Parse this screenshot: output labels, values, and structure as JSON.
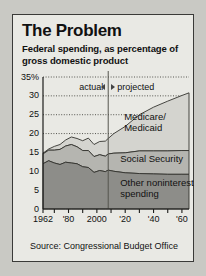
{
  "card": {
    "title": "The Problem",
    "subtitle": "Federal spending, as percentage of gross domestic product",
    "source": "Source: Congressional Budget Office"
  },
  "annotations": {
    "actual_label": "actual",
    "projected_label": "projected",
    "left_arrow": "arrow-left-icon",
    "right_arrow": "arrow-right-icon",
    "divider_year": 2008
  },
  "chart_data": {
    "type": "area",
    "stacked": true,
    "title": "Federal spending, as percentage of gross domestic product",
    "xlabel": "",
    "ylabel": "",
    "xlim": [
      1962,
      2065
    ],
    "ylim": [
      0,
      35
    ],
    "ytick_values": [
      0,
      5,
      10,
      15,
      20,
      25,
      30,
      35
    ],
    "ytick_labels": [
      "0",
      "5",
      "10",
      "15",
      "20",
      "25",
      "30",
      "35%"
    ],
    "xtick_values": [
      1962,
      1970,
      1980,
      1990,
      2000,
      2010,
      2020,
      2030,
      2040,
      2050,
      2060
    ],
    "xtick_labels": [
      "1962",
      "",
      "'80",
      "",
      "2000",
      "",
      "'20",
      "",
      "'40",
      "",
      "'60"
    ],
    "grid": "horizontal-dotted",
    "legend_position": "inline-band-labels",
    "series": [
      {
        "name": "Other noninterest spending",
        "color": "#8d8d89",
        "x": [
          1962,
          1966,
          1970,
          1974,
          1978,
          1982,
          1986,
          1990,
          1994,
          1998,
          2002,
          2006,
          2008,
          2012,
          2020,
          2030,
          2040,
          2050,
          2060,
          2065
        ],
        "values": [
          12.0,
          12.8,
          12.2,
          11.8,
          12.4,
          12.2,
          12.0,
          11.2,
          11.0,
          9.7,
          10.2,
          9.9,
          10.3,
          10.0,
          9.6,
          9.4,
          9.3,
          9.2,
          9.2,
          9.2
        ]
      },
      {
        "name": "Social Security",
        "color": "#b5b5b0",
        "x": [
          1962,
          1966,
          1970,
          1974,
          1978,
          1982,
          1986,
          1990,
          1994,
          1998,
          2002,
          2006,
          2008,
          2012,
          2020,
          2030,
          2040,
          2050,
          2060,
          2065
        ],
        "values": [
          2.6,
          2.8,
          3.4,
          4.0,
          4.3,
          4.9,
          4.5,
          4.3,
          4.5,
          4.2,
          4.2,
          4.1,
          4.3,
          4.8,
          5.3,
          6.0,
          6.1,
          6.2,
          6.3,
          6.3
        ]
      },
      {
        "name": "Medicare/Medicaid",
        "color": "#d4d4cf",
        "x": [
          1962,
          1966,
          1970,
          1974,
          1978,
          1982,
          1986,
          1990,
          1994,
          1998,
          2002,
          2006,
          2008,
          2012,
          2020,
          2030,
          2040,
          2050,
          2060,
          2065
        ],
        "values": [
          0.2,
          0.3,
          1.0,
          1.3,
          1.6,
          2.0,
          2.2,
          2.6,
          3.3,
          3.2,
          3.5,
          4.0,
          4.1,
          5.2,
          7.0,
          9.6,
          11.6,
          13.2,
          14.6,
          15.3
        ]
      }
    ],
    "band_labels": [
      "Medicare/Medicaid",
      "Social Security",
      "Other noninterest spending"
    ]
  }
}
